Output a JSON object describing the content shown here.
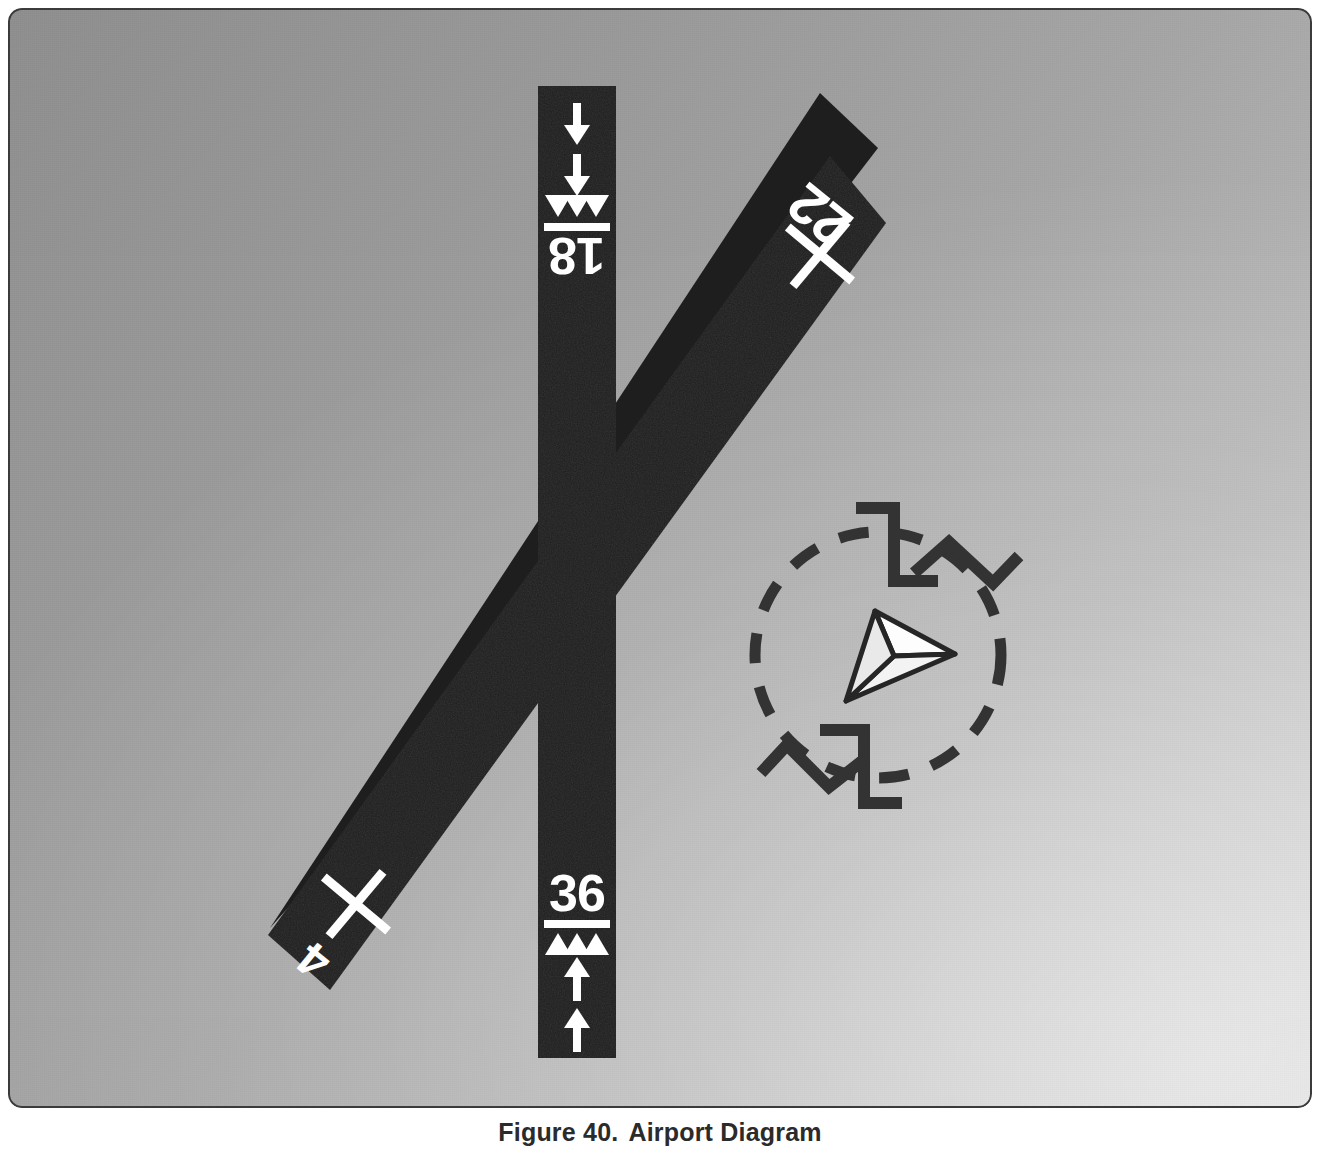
{
  "figure": {
    "label": "Figure 40.",
    "title": "Airport Diagram",
    "caption_full": "Figure 40. Airport Diagram"
  },
  "colors": {
    "pavement": "#1e1e1e",
    "marking": "#ffffff",
    "ground_dark": "#8f8f8f",
    "ground_light": "#d6d6d6",
    "ink": "#333333",
    "caption": "#2b2b2b"
  },
  "diagram": {
    "type": "airport-layout",
    "runways": [
      {
        "name": "runway-18-36",
        "orientation": "north-south",
        "designators": [
          {
            "id": "18",
            "end": "north",
            "rotated": true,
            "status": "open"
          },
          {
            "id": "36",
            "end": "south",
            "rotated": false,
            "status": "open"
          }
        ],
        "markings": {
          "threshold_bar": true,
          "displaced_threshold_chevrons": 3,
          "approach_arrows": 2
        }
      },
      {
        "name": "runway-4-22",
        "orientation": "northeast-southwest",
        "bearing_deg": 40,
        "designators": [
          {
            "id": "22",
            "end": "northeast",
            "rotated": true,
            "status": "closed"
          },
          {
            "id": "4",
            "end": "southwest",
            "rotated": true,
            "status": "closed"
          }
        ],
        "markings": {
          "closed_runway_x": 2
        }
      }
    ],
    "segmented_circle": {
      "name": "segmented-circle",
      "dashed_ring": true,
      "landing_strip_indicators": [
        {
          "name": "strip-indicator-north",
          "for_runway": "18-36",
          "position": "top"
        },
        {
          "name": "strip-indicator-south",
          "for_runway": "18-36",
          "position": "bottom"
        },
        {
          "name": "strip-indicator-northeast",
          "for_runway": "4-22",
          "position": "upper-right"
        },
        {
          "name": "strip-indicator-southwest",
          "for_runway": "4-22",
          "position": "lower-left"
        }
      ],
      "wind_indicator": {
        "name": "wind-tetrahedron",
        "type": "tetrahedron",
        "points_to": "east"
      }
    }
  }
}
